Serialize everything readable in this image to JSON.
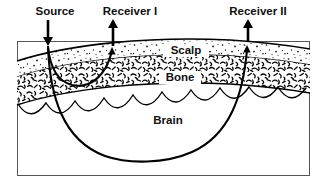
{
  "figure": {
    "background_color": "#ffffff",
    "ink_color": "#000000",
    "frame": {
      "name": "diagram-frame",
      "x": 17,
      "y": 41,
      "width": 293,
      "height": 135,
      "stroke_color": "#555555"
    }
  },
  "top_labels": [
    {
      "id": "source",
      "text": "Source",
      "x": 55,
      "y": 14
    },
    {
      "id": "receiver-1",
      "text": "Receiver I",
      "x": 130,
      "y": 14
    },
    {
      "id": "receiver-2",
      "text": "Receiver II",
      "x": 258,
      "y": 14
    }
  ],
  "arrows": [
    {
      "id": "source-arrow",
      "direction": "down",
      "x": 48,
      "y_start": 20,
      "y_end": 45,
      "label": "Source"
    },
    {
      "id": "receiver-1-arrow",
      "direction": "up",
      "x": 113,
      "y_start": 48,
      "y_end": 20,
      "label": "Receiver I"
    },
    {
      "id": "receiver-2-arrow",
      "direction": "up",
      "x": 248,
      "y_start": 44,
      "y_end": 20,
      "label": "Receiver II"
    }
  ],
  "layers": [
    {
      "id": "scalp",
      "label": "Scalp",
      "label_x": 186,
      "label_y": 54,
      "texture": "stipple-dots",
      "fill": "#ffffff"
    },
    {
      "id": "bone",
      "label": "Bone",
      "label_x": 180,
      "label_y": 81,
      "texture": "dense-squiggle",
      "fill": "#ffffff"
    },
    {
      "id": "brain",
      "label": "Brain",
      "label_x": 168,
      "label_y": 124,
      "texture": "gyri-scallops",
      "fill": "#ffffff"
    }
  ],
  "ray_paths": [
    {
      "id": "shallow-ray",
      "from": "Source",
      "to": "Receiver I",
      "shape": "shallow-banana-arc",
      "max_depth_layer": "Bone"
    },
    {
      "id": "deep-ray",
      "from": "Source",
      "to": "Receiver II",
      "shape": "deep-u-arc",
      "max_depth_layer": "Brain"
    }
  ],
  "colors": {
    "ink": "#000000",
    "frame": "#555555",
    "page": "#ffffff"
  }
}
